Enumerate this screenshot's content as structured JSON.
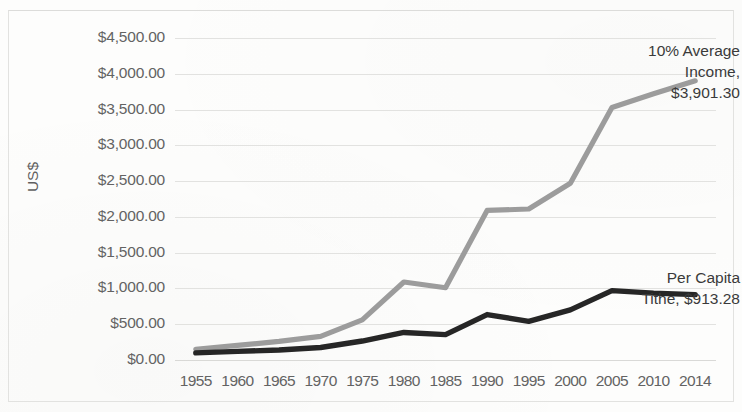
{
  "chart_data": {
    "type": "line",
    "title": "",
    "xlabel": "",
    "ylabel": "US$",
    "ylim": [
      0,
      4500
    ],
    "ytick_step": 500,
    "grid": true,
    "legend": "none (direct labels)",
    "categories": [
      "1955",
      "1960",
      "1965",
      "1970",
      "1975",
      "1980",
      "1985",
      "1990",
      "1995",
      "2000",
      "2005",
      "2010",
      "2014"
    ],
    "yticks": [
      "$0.00",
      "$500.00",
      "$1,000.00",
      "$1,500.00",
      "$2,000.00",
      "$2,500.00",
      "$3,000.00",
      "$3,500.00",
      "$4,000.00",
      "$4,500.00"
    ],
    "series": [
      {
        "name": "10% Average Income",
        "color": "#9c9c9c",
        "values": [
          150,
          205,
          260,
          330,
          560,
          1090,
          1010,
          2090,
          2110,
          2470,
          3530,
          3720,
          3901.3
        ],
        "end_label": "$3,901.30"
      },
      {
        "name": "Per Capita Tithe",
        "color": "#262626",
        "values": [
          100,
          120,
          140,
          175,
          265,
          385,
          355,
          635,
          540,
          700,
          970,
          935,
          913.28
        ],
        "end_label": "$913.28"
      }
    ],
    "annotations": [
      {
        "id": "income-annotation",
        "text": "10% Average\nIncome,\n$3,901.30",
        "series": "10% Average Income"
      },
      {
        "id": "tithe-annotation",
        "text": "Per Capita\nTithe, $913.28",
        "series": "Per Capita Tithe"
      }
    ],
    "colors": {
      "income_line": "#9c9c9c",
      "tithe_line": "#262626",
      "gridline": "#dddddb",
      "tick_text": "#636363",
      "annotation_text": "#3a3a3a",
      "background": "#fdfdfc"
    }
  }
}
